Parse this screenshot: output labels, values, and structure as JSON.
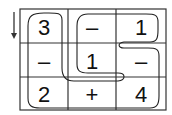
{
  "puzzle": {
    "direction_arrow": "down",
    "grid": {
      "rows": 3,
      "cols": 3,
      "cells": [
        [
          "3",
          "–",
          "1"
        ],
        [
          "–",
          "1",
          "–"
        ],
        [
          "2",
          "+",
          "4"
        ]
      ]
    },
    "colors": {
      "line": "#222222",
      "background": "#ffffff"
    }
  }
}
